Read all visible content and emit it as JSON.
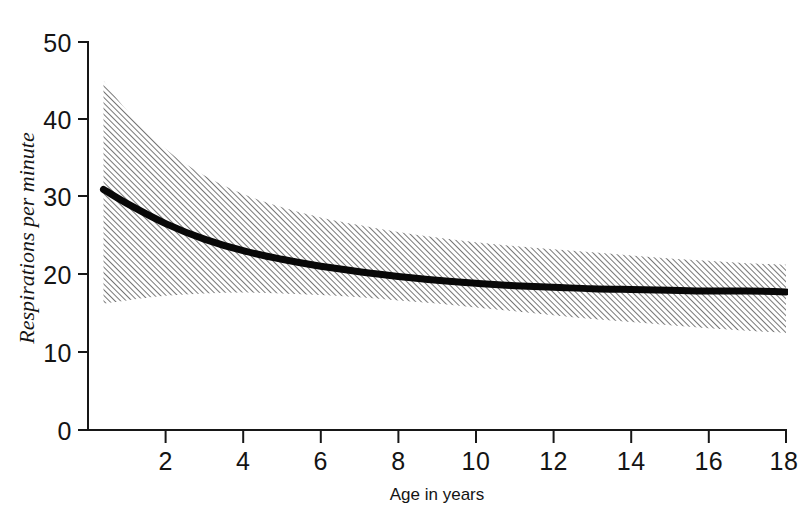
{
  "chart_data": {
    "type": "line",
    "title": "",
    "xlabel": "Age in years",
    "ylabel": "Respirations per minute",
    "xlim": [
      0,
      18
    ],
    "ylim": [
      0,
      50
    ],
    "grid": false,
    "legend": "none",
    "x_ticks": [
      2,
      4,
      6,
      8,
      10,
      12,
      14,
      16,
      18
    ],
    "y_ticks": [
      0,
      10,
      20,
      30,
      40,
      50
    ],
    "x": [
      0.4,
      1,
      2,
      3,
      4,
      5,
      6,
      7,
      8,
      9,
      10,
      11,
      12,
      13,
      14,
      15,
      16,
      17,
      18
    ],
    "series": [
      {
        "name": "Mean respiratory rate",
        "style": "solid-thick-black",
        "values": [
          31.0,
          29.2,
          26.6,
          24.6,
          23.1,
          22.0,
          21.1,
          20.4,
          19.8,
          19.3,
          18.9,
          18.6,
          18.4,
          18.2,
          18.1,
          18.0,
          17.9,
          17.9,
          17.8
        ]
      },
      {
        "name": "Upper range of normal",
        "style": "hatched-band-edge",
        "values": [
          45.0,
          41.2,
          36.2,
          32.8,
          30.4,
          28.7,
          27.4,
          26.4,
          25.5,
          24.8,
          24.2,
          23.7,
          23.3,
          22.9,
          22.5,
          22.1,
          21.8,
          21.5,
          21.3
        ]
      },
      {
        "name": "Lower range of normal",
        "style": "hatched-band-edge",
        "values": [
          16.3,
          16.7,
          17.3,
          17.6,
          17.7,
          17.6,
          17.4,
          17.1,
          16.7,
          16.3,
          15.8,
          15.3,
          14.8,
          14.3,
          13.9,
          13.5,
          13.1,
          12.8,
          12.5
        ]
      }
    ],
    "band": {
      "name": "Normal range (hatched area)",
      "pattern": "diagonal-hatch",
      "upper_series": "Upper range of normal",
      "lower_series": "Lower range of normal"
    },
    "colors": {
      "axis": "#171717",
      "curve": "#080808",
      "hatch": "#4d4d4d",
      "background": "#ffffff"
    }
  },
  "axes": {
    "y_title": "Respirations per minute",
    "x_title": "Age in years",
    "y_tick_labels": [
      "50",
      "40",
      "30",
      "20",
      "10",
      "0"
    ],
    "x_tick_labels": [
      "2",
      "4",
      "6",
      "8",
      "10",
      "12",
      "14",
      "16",
      "18"
    ]
  },
  "caption": {
    "partial_text": "clipped caption line"
  }
}
